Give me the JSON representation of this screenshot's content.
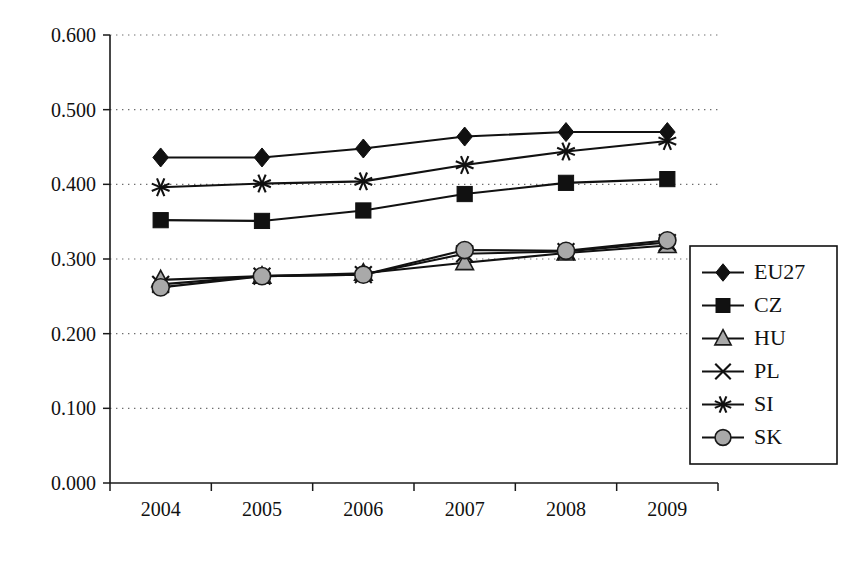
{
  "chart_data": {
    "type": "line",
    "title": "",
    "subtitle": "",
    "xlabel": "",
    "ylabel": "",
    "categories": [
      "2004",
      "2005",
      "2006",
      "2007",
      "2008",
      "2009"
    ],
    "x": [
      2004,
      2005,
      2006,
      2007,
      2008,
      2009
    ],
    "ylim": [
      0.0,
      0.6
    ],
    "ytick_values": [
      0.0,
      0.1,
      0.2,
      0.3,
      0.4,
      0.5,
      0.6
    ],
    "ytick_labels": [
      "0.000",
      "0.100",
      "0.200",
      "0.300",
      "0.400",
      "0.500",
      "0.600"
    ],
    "xtick_labels": [
      "2004",
      "2005",
      "2006",
      "2007",
      "2008",
      "2009"
    ],
    "grid": true,
    "grid_axis": "y",
    "grid_style": "dotted",
    "legend_position": "right",
    "series": [
      {
        "name": "EU27",
        "marker": "diamond",
        "marker_fill": "#111111",
        "line_color": "#111111",
        "values": [
          0.436,
          0.436,
          0.448,
          0.464,
          0.47,
          0.47
        ]
      },
      {
        "name": "CZ",
        "marker": "square",
        "marker_fill": "#111111",
        "line_color": "#111111",
        "values": [
          0.352,
          0.351,
          0.365,
          0.387,
          0.402,
          0.407
        ]
      },
      {
        "name": "HU",
        "marker": "triangle",
        "marker_fill": "#a9a9a9",
        "line_color": "#111111",
        "values": [
          0.272,
          0.277,
          0.281,
          0.295,
          0.308,
          0.318
        ]
      },
      {
        "name": "PL",
        "marker": "x-cross",
        "marker_fill": "none",
        "line_color": "#111111",
        "values": [
          0.266,
          0.277,
          0.279,
          0.307,
          0.31,
          0.322
        ]
      },
      {
        "name": "SI",
        "marker": "asterisk",
        "marker_fill": "none",
        "line_color": "#111111",
        "values": [
          0.396,
          0.401,
          0.404,
          0.426,
          0.444,
          0.458
        ]
      },
      {
        "name": "SK",
        "marker": "circle",
        "marker_fill": "#a9a9a9",
        "line_color": "#111111",
        "values": [
          0.262,
          0.277,
          0.279,
          0.312,
          0.311,
          0.325
        ]
      }
    ]
  },
  "legend": {
    "entries": [
      {
        "label": "EU27",
        "icon": "diamond-marker-icon"
      },
      {
        "label": "CZ",
        "icon": "square-marker-icon"
      },
      {
        "label": "HU",
        "icon": "triangle-marker-icon"
      },
      {
        "label": "PL",
        "icon": "x-cross-marker-icon"
      },
      {
        "label": "SI",
        "icon": "asterisk-marker-icon"
      },
      {
        "label": "SK",
        "icon": "circle-marker-icon"
      }
    ]
  },
  "colors": {
    "axis": "#1a1a1a",
    "grid": "#6e6e6e",
    "text": "#111111",
    "marker_dark": "#111111",
    "marker_gray": "#a9a9a9",
    "background": "#ffffff"
  }
}
